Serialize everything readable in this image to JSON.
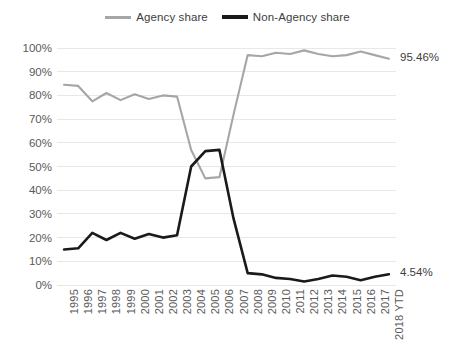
{
  "legend": {
    "position": "top-center",
    "entries": [
      {
        "label": "Agency share",
        "color": "#a6a6a6",
        "icon": "line-swatch-icon"
      },
      {
        "label": "Non-Agency share",
        "color": "#1a1a1a",
        "icon": "line-swatch-icon"
      }
    ]
  },
  "labels": {
    "agency_end": "95.46%",
    "nonagency_end": "4.54%"
  },
  "chart_data": {
    "type": "line",
    "title": "",
    "subtitle": "",
    "xlabel": "",
    "ylabel": "",
    "ylim": [
      0,
      100
    ],
    "yticks": [
      "0%",
      "10%",
      "20%",
      "30%",
      "40%",
      "50%",
      "60%",
      "70%",
      "80%",
      "90%",
      "100%"
    ],
    "ytick_values": [
      0,
      10,
      20,
      30,
      40,
      50,
      60,
      70,
      80,
      90,
      100
    ],
    "grid": "horizontal",
    "legend_position": "top-center",
    "categories": [
      "1995",
      "1996",
      "1997",
      "1998",
      "1999",
      "2000",
      "2001",
      "2002",
      "2003",
      "2004",
      "2005",
      "2006",
      "2007",
      "2008",
      "2009",
      "2010",
      "2011",
      "2012",
      "2013",
      "2014",
      "2015",
      "2016",
      "2017",
      "2018 YTD"
    ],
    "series": [
      {
        "name": "Agency share",
        "color": "#a6a6a6",
        "end_label": "95.46%",
        "values": [
          84.5,
          84.0,
          77.5,
          81.0,
          78.0,
          80.5,
          78.5,
          80.0,
          79.5,
          57.0,
          45.0,
          45.5,
          72.0,
          97.0,
          96.5,
          98.0,
          97.5,
          99.0,
          97.5,
          96.5,
          97.0,
          98.5,
          97.0,
          95.46
        ]
      },
      {
        "name": "Non-Agency share",
        "color": "#1a1a1a",
        "end_label": "4.54%",
        "values": [
          15.0,
          15.5,
          22.0,
          19.0,
          22.0,
          19.5,
          21.5,
          20.0,
          21.0,
          50.0,
          56.5,
          57.0,
          28.0,
          5.0,
          4.5,
          3.0,
          2.5,
          1.5,
          2.5,
          4.0,
          3.5,
          2.0,
          3.5,
          4.54
        ]
      }
    ]
  }
}
